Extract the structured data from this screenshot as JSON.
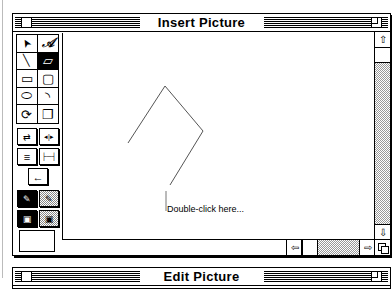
{
  "window": {
    "title": "Insert Picture"
  },
  "palette": {
    "tools": [
      {
        "name": "arrow-tool",
        "glyph": "➤",
        "selected": false
      },
      {
        "name": "text-tool",
        "glyph": "𝒜",
        "selected": false
      },
      {
        "name": "line-tool",
        "glyph": "╲",
        "selected": false
      },
      {
        "name": "polygon-tool",
        "glyph": "▱",
        "selected": true
      },
      {
        "name": "rectangle-tool",
        "glyph": "▭",
        "selected": false
      },
      {
        "name": "rounded-rectangle-tool",
        "glyph": "▢",
        "selected": false
      },
      {
        "name": "oval-tool",
        "glyph": "⬭",
        "selected": false
      },
      {
        "name": "arc-tool",
        "glyph": "◝",
        "selected": false
      },
      {
        "name": "rotate-tool",
        "glyph": "⟳",
        "selected": false
      },
      {
        "name": "duplicate-tool",
        "glyph": "❐",
        "selected": false
      }
    ],
    "buttons": [
      {
        "name": "flip-button",
        "glyph": "⇄"
      },
      {
        "name": "distribute-button",
        "glyph": "◂|▸"
      },
      {
        "name": "align-button",
        "glyph": "≡"
      },
      {
        "name": "line-width-button",
        "glyph": "├─┤"
      },
      {
        "name": "arrowhead-button",
        "glyph": "←"
      },
      {
        "name": "pen-color-button",
        "glyph": "✎"
      },
      {
        "name": "pen-pattern-button",
        "glyph": "✎"
      },
      {
        "name": "fill-color-button",
        "glyph": "▣"
      },
      {
        "name": "fill-pattern-button",
        "glyph": "▣"
      }
    ]
  },
  "canvas": {
    "label": "Double-click here..."
  },
  "scrollbars": {
    "up_arrow": "⇧",
    "down_arrow": "⇩",
    "left_arrow": "⇦",
    "right_arrow": "⇨"
  },
  "second_window": {
    "title": "Edit Picture"
  }
}
